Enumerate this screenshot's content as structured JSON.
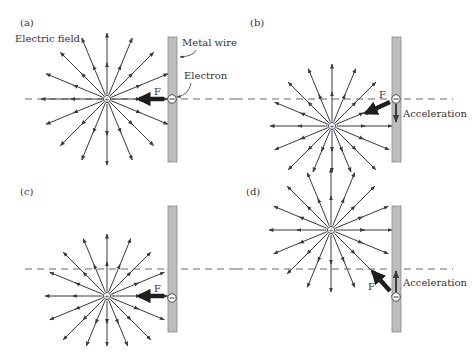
{
  "figure": {
    "panels": [
      {
        "id": "a",
        "label": "(a)",
        "annotations": {
          "field_label": "Electric field",
          "wire_label": "Metal wire",
          "electron_label": "Electron",
          "force_label": "F",
          "acceleration_label": ""
        },
        "charge_symbol": "+",
        "electron_symbol": "−",
        "force_direction": "left",
        "acceleration_direction": "none"
      },
      {
        "id": "b",
        "label": "(b)",
        "annotations": {
          "field_label": "",
          "wire_label": "",
          "electron_label": "",
          "force_label": "F",
          "acceleration_label": "Acceleration"
        },
        "charge_symbol": "+",
        "electron_symbol": "−",
        "force_direction": "down-left",
        "acceleration_direction": "down"
      },
      {
        "id": "c",
        "label": "(c)",
        "annotations": {
          "field_label": "",
          "wire_label": "",
          "electron_label": "",
          "force_label": "F",
          "acceleration_label": ""
        },
        "charge_symbol": "+",
        "electron_symbol": "−",
        "force_direction": "left",
        "acceleration_direction": "none"
      },
      {
        "id": "d",
        "label": "(d)",
        "annotations": {
          "field_label": "",
          "wire_label": "",
          "electron_label": "",
          "force_label": "F",
          "acceleration_label": "Acceleration"
        },
        "charge_symbol": "+",
        "electron_symbol": "−",
        "force_direction": "up-left",
        "acceleration_direction": "up"
      }
    ],
    "field_line_count": 16,
    "colors": {
      "line": "#3a3a3a",
      "wire_fill": "#bdbdbd",
      "text": "#333333"
    }
  }
}
